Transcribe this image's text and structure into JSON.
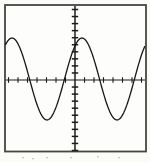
{
  "figure": {
    "visible_text": "none (only illegible cropped text fragments at bottom edge)"
  },
  "colors": {
    "page_background": "#fbfbf8",
    "plot_background": "#fdfdfb",
    "frame": "#454543",
    "axis": "#1c1c1c",
    "tick": "#1c1c1c",
    "curve": "#171717",
    "artifact": "#8f8f85"
  },
  "chart_data": {
    "type": "line",
    "title": "",
    "xlabel": "",
    "ylabel": "",
    "grid": false,
    "legend": false,
    "axis_numbers_visible": false,
    "curve": "sinusoid",
    "amplitude_tick_units": 6,
    "period_tick_units": 7.4,
    "peak_offset_tick_units": 0.7,
    "x_range_tick_units": [
      -7.4,
      7.5
    ],
    "y_range_tick_units": [
      -10.2,
      10.6
    ],
    "x_tick_interval_units": 1,
    "y_tick_interval_units": 1,
    "x_ticks_per_side": 7,
    "y_ticks_per_side": 10,
    "key_points_px": {
      "maxima": [
        [
          14,
          38
        ],
        [
          81,
          38
        ]
      ],
      "minima": [
        [
          43,
          119
        ],
        [
          116,
          119
        ]
      ],
      "x_axis_crossings": [
        29,
        64,
        99,
        134
      ]
    },
    "pixel_geometry": {
      "plot": {
        "left": 5,
        "top": 5,
        "right": 146,
        "bottom": 151.5
      },
      "y_axis_x": 75,
      "x_axis_y": 80,
      "x_tick_spacing": 9.5,
      "y_tick_spacing": 7.05,
      "center_y": 79,
      "amplitude": 41,
      "period": 70,
      "peak_x": 82
    },
    "artifact_specks_px": [
      [
        22,
        157
      ],
      [
        32,
        158
      ],
      [
        46,
        157
      ],
      [
        70,
        157
      ],
      [
        97,
        156
      ],
      [
        118,
        157
      ]
    ]
  }
}
